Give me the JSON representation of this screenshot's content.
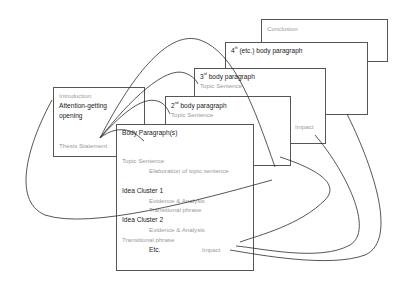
{
  "boxes": {
    "conclusion": {
      "title": "Conclusion"
    },
    "fourth": {
      "title_prefix": "4",
      "title_sup": "th",
      "title_suffix": " (etc.) body paragraph"
    },
    "third": {
      "title_prefix": "3",
      "title_sup": "rd",
      "title_suffix": " body paragraph",
      "topic": "Topic Sentence",
      "impact": "Impact"
    },
    "second": {
      "title_prefix": "2",
      "title_sup": "nd",
      "title_suffix": " body paragraph",
      "topic": "Topic Sentence"
    },
    "intro": {
      "title": "Introduction",
      "attention_line1": "Attention-getting",
      "attention_line2": "opening",
      "thesis": "Thesis Statement"
    },
    "body": {
      "title": "Body Paragraph(s)",
      "topic": "Topic Sentence",
      "elaboration": "Elaboration of topic sentence",
      "cluster1": "Idea Cluster 1",
      "evidence1": "Evidence & Analysis",
      "transition1": "Transitional phrase",
      "cluster2": "Idea Cluster 2",
      "evidence2": "Evidence & Analysis",
      "transition2": "Transitional phrase",
      "etc": "Etc.",
      "impact": "Impact"
    }
  },
  "colors": {
    "line": "#2b2b2b",
    "dark_text": "#1a1a1a",
    "light_text": "#9a9a9a",
    "border": "#555555"
  }
}
